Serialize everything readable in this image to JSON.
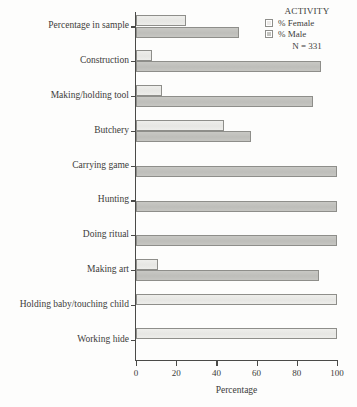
{
  "chart_data": {
    "type": "bar",
    "orientation": "horizontal",
    "title": "",
    "xlabel": "Percentage",
    "ylabel": "",
    "xlim": [
      0,
      100
    ],
    "xticks": [
      0,
      20,
      40,
      60,
      80,
      100
    ],
    "xtick_labels": [
      "0",
      "20",
      "40",
      "60",
      "80",
      "100"
    ],
    "grid": false,
    "legend_position": "top-right",
    "legend_title": "ACTIVITY",
    "annotation": "N = 331",
    "categories": [
      "Percentage in sample",
      "Construction",
      "Making/holding tool",
      "Butchery",
      "Carrying game",
      "Hunting",
      "Doing ritual",
      "Making art",
      "Holding baby/touching child",
      "Working hide"
    ],
    "series": [
      {
        "name": "% Female",
        "color": "#e8e8e5",
        "values": [
          25,
          8,
          13,
          44,
          0,
          0,
          0,
          11,
          100,
          100
        ]
      },
      {
        "name": "% Male",
        "color": "#c3c3bf",
        "values": [
          51,
          92,
          88,
          57,
          100,
          100,
          100,
          91,
          0,
          0
        ]
      }
    ]
  },
  "legend": {
    "title": "ACTIVITY",
    "entries": [
      {
        "label": "% Female"
      },
      {
        "label": "% Male"
      }
    ],
    "note": "N = 331"
  },
  "axes": {
    "x_title": "Percentage",
    "x_tick_labels": [
      "0",
      "20",
      "40",
      "60",
      "80",
      "100"
    ]
  },
  "colors": {
    "female_fill": "#e8e8e5",
    "male_fill": "#c3c3bf",
    "bar_border": "#8e8e8a",
    "axis": "#4a4a48",
    "text": "#3c3c3a",
    "background": "#fdfdfc"
  }
}
